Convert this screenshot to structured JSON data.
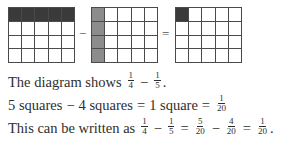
{
  "diagram": {
    "grids": [
      {
        "id": "one-quarter",
        "rows": 4,
        "cols": 5,
        "shaded": "top-row",
        "shade_color": "#3a3a3a",
        "shaded_count": 5
      },
      {
        "id": "one-fifth",
        "rows": 4,
        "cols": 5,
        "shaded": "left-column",
        "shade_color": "#8c8c8c",
        "shaded_count": 4
      },
      {
        "id": "one-twentieth",
        "rows": 4,
        "cols": 5,
        "shaded": "top-left-cell",
        "shade_color": "#3a3a3a",
        "shaded_count": 1
      }
    ],
    "operators": {
      "minus": "−",
      "equals": "="
    }
  },
  "text": {
    "line1": {
      "prefix": "The diagram shows",
      "frac_a": {
        "num": "1",
        "den": "4"
      },
      "op": "−",
      "frac_b": {
        "num": "1",
        "den": "5"
      },
      "suffix": "."
    },
    "line2": {
      "a": "5 squares",
      "op1": "−",
      "b": "4 squares",
      "op2": "=",
      "c": "1 square",
      "op3": "=",
      "frac": {
        "num": "1",
        "den": "20"
      }
    },
    "line3": {
      "prefix": "This can be written as",
      "f1": {
        "num": "1",
        "den": "4"
      },
      "op1": "−",
      "f2": {
        "num": "1",
        "den": "5"
      },
      "op2": "=",
      "f3": {
        "num": "5",
        "den": "20"
      },
      "op3": "−",
      "f4": {
        "num": "4",
        "den": "20"
      },
      "op4": "=",
      "f5": {
        "num": "1",
        "den": "20"
      },
      "suffix": "."
    }
  },
  "colors": {
    "dark_shade": "#3a3a3a",
    "mid_shade": "#8c8c8c",
    "grid_line": "#4a4a4a",
    "text": "#2e2e2e"
  }
}
